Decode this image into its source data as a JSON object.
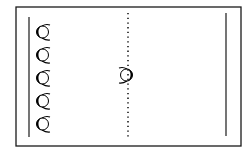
{
  "diagram": {
    "type": "sports-drill-court",
    "colors": {
      "background": "#ffffff",
      "line": "#1a1a1a",
      "player_fill": "#000000"
    },
    "court": {
      "outer": {
        "x": 16,
        "y": 7,
        "width": 225,
        "height": 139
      },
      "left_line": {
        "x": 29,
        "y1": 17,
        "y2": 137
      },
      "right_line": {
        "x": 226,
        "y1": 13,
        "y2": 136
      },
      "center_dotted_line": {
        "x": 128,
        "y1": 13,
        "y2": 138
      }
    },
    "players": [
      {
        "id": "p1",
        "group": "left-line",
        "x": 42,
        "y": 32,
        "facing": "right"
      },
      {
        "id": "p2",
        "group": "left-line",
        "x": 42,
        "y": 55,
        "facing": "right"
      },
      {
        "id": "p3",
        "group": "left-line",
        "x": 42,
        "y": 78,
        "facing": "right"
      },
      {
        "id": "p4",
        "group": "left-line",
        "x": 42,
        "y": 101,
        "facing": "right"
      },
      {
        "id": "p5",
        "group": "left-line",
        "x": 42,
        "y": 124,
        "facing": "right"
      },
      {
        "id": "p6",
        "group": "center",
        "x": 127,
        "y": 75,
        "facing": "left"
      }
    ]
  }
}
